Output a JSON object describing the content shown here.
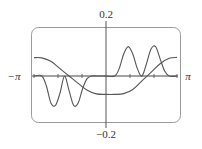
{
  "chart_data": {
    "type": "line",
    "title": "",
    "xlabel": "",
    "ylabel": "",
    "xlim": [
      -3.14159,
      3.14159
    ],
    "ylim": [
      -0.2,
      0.2
    ],
    "grid": false,
    "legend": null,
    "x_tick_labels": {
      "left": "−π",
      "right": "π"
    },
    "y_tick_labels": {
      "top": "0.2",
      "bottom": "−0.2"
    },
    "series": [
      {
        "name": "smooth step (odd)",
        "x": [
          -3.14,
          -2.8,
          -2.4,
          -2.0,
          -1.6,
          -1.2,
          -0.8,
          -0.4,
          0.0,
          0.4,
          0.8,
          1.2,
          1.6,
          2.0,
          2.4,
          2.8,
          3.14
        ],
        "y": [
          0.075,
          0.074,
          0.06,
          0.03,
          0.0,
          -0.03,
          -0.058,
          -0.073,
          -0.075,
          -0.075,
          -0.072,
          -0.055,
          -0.02,
          0.015,
          0.05,
          0.072,
          0.076
        ]
      },
      {
        "name": "wave packets",
        "x": [
          -3.14,
          -2.8,
          -2.6,
          -2.4,
          -2.2,
          -2.0,
          -1.8,
          -1.6,
          -1.4,
          -1.2,
          -1.0,
          -0.8,
          -0.6,
          -0.4,
          0.0,
          0.4,
          0.6,
          0.8,
          1.0,
          1.2,
          1.4,
          1.6,
          1.8,
          2.0,
          2.2,
          2.4,
          2.6,
          2.8,
          3.14
        ],
        "y": [
          0.0,
          0.0,
          -0.04,
          -0.11,
          -0.12,
          -0.07,
          0.0,
          -0.06,
          -0.12,
          -0.11,
          -0.05,
          -0.01,
          0.0,
          0.0,
          0.0,
          0.0,
          0.03,
          0.09,
          0.12,
          0.09,
          0.03,
          0.0,
          0.05,
          0.11,
          0.12,
          0.07,
          0.02,
          0.0,
          0.0
        ]
      }
    ]
  }
}
